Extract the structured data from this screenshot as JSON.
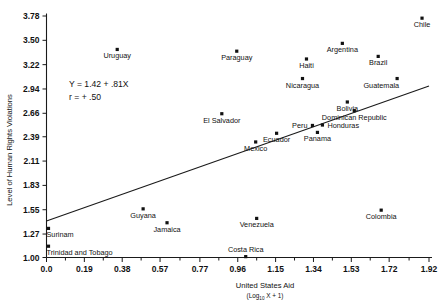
{
  "chart_data": {
    "type": "scatter",
    "title": "",
    "xlabel": "United States Aid",
    "xlabel_sub": "(Log",
    "xlabel_sub_index": "10",
    "xlabel_sub_tail": " X + 1)",
    "ylabel": "Level of Human Rights Violations",
    "xlim": [
      -0.06,
      1.98
    ],
    "ylim": [
      0.93,
      3.86
    ],
    "grid": false,
    "legend": null,
    "xticks": [
      "0.0",
      "0.19",
      "0.38",
      "0.57",
      "0.77",
      "0.96",
      "1.15",
      "1.34",
      "1.53",
      "1.72",
      "1.92"
    ],
    "xtick_values": [
      0.0,
      0.19,
      0.38,
      0.57,
      0.77,
      0.96,
      1.15,
      1.34,
      1.53,
      1.72,
      1.92
    ],
    "yticks": [
      "1.00",
      "1.27",
      "1.55",
      "1.83",
      "2.11",
      "2.39",
      "2.66",
      "2.94",
      "3.22",
      "3.50",
      "3.78"
    ],
    "ytick_values": [
      1.0,
      1.27,
      1.55,
      1.83,
      2.11,
      2.39,
      2.66,
      2.94,
      3.22,
      3.5,
      3.78
    ],
    "annotations": {
      "equation": "Y = 1.42 + .81X",
      "correlation": "r = + .50"
    },
    "regression": {
      "intercept": 1.42,
      "slope": 0.81,
      "r": 0.5,
      "x_start": 0.0,
      "x_end": 1.92
    },
    "points": [
      {
        "label": "Chile",
        "x": 1.885,
        "y": 3.755,
        "label_pos": "below"
      },
      {
        "label": "Argentina",
        "x": 1.485,
        "y": 3.465,
        "label_pos": "below"
      },
      {
        "label": "Brazil",
        "x": 1.665,
        "y": 3.315,
        "label_pos": "below"
      },
      {
        "label": "Uruguay",
        "x": 0.355,
        "y": 3.395,
        "label_pos": "below"
      },
      {
        "label": "Paraguay",
        "x": 0.955,
        "y": 3.375,
        "label_pos": "below"
      },
      {
        "label": "Haiti",
        "x": 1.305,
        "y": 3.285,
        "label_pos": "below"
      },
      {
        "label": "Nicaragua",
        "x": 1.285,
        "y": 3.06,
        "label_pos": "below"
      },
      {
        "label": "Guatemala",
        "x": 1.76,
        "y": 3.06,
        "label_pos": "below-left"
      },
      {
        "label": "Bolivia",
        "x": 1.51,
        "y": 2.79,
        "label_pos": "below"
      },
      {
        "label": "Dominican Republic",
        "x": 1.545,
        "y": 2.69,
        "label_pos": "below"
      },
      {
        "label": "Honduras",
        "x": 1.385,
        "y": 2.525,
        "label_pos": "right"
      },
      {
        "label": "Peru",
        "x": 1.335,
        "y": 2.52,
        "label_pos": "left"
      },
      {
        "label": "Panama",
        "x": 1.36,
        "y": 2.44,
        "label_pos": "below"
      },
      {
        "label": "Ecuador",
        "x": 1.155,
        "y": 2.43,
        "label_pos": "below"
      },
      {
        "label": "Mexico",
        "x": 1.05,
        "y": 2.33,
        "label_pos": "below"
      },
      {
        "label": "El Salvador",
        "x": 0.88,
        "y": 2.655,
        "label_pos": "below"
      },
      {
        "label": "Guyana",
        "x": 0.485,
        "y": 1.56,
        "label_pos": "below"
      },
      {
        "label": "Jamaica",
        "x": 0.605,
        "y": 1.4,
        "label_pos": "below"
      },
      {
        "label": "Venezuela",
        "x": 1.055,
        "y": 1.45,
        "label_pos": "below"
      },
      {
        "label": "Colombia",
        "x": 1.68,
        "y": 1.545,
        "label_pos": "below"
      },
      {
        "label": "Costa Rica",
        "x": 1.0,
        "y": 1.01,
        "label_pos": "above"
      },
      {
        "label": "Surinam",
        "x": 0.01,
        "y": 1.335,
        "label_pos": "below-right"
      },
      {
        "label": "Trinidad and Tobago",
        "x": 0.01,
        "y": 1.13,
        "label_pos": "below-right"
      }
    ]
  }
}
